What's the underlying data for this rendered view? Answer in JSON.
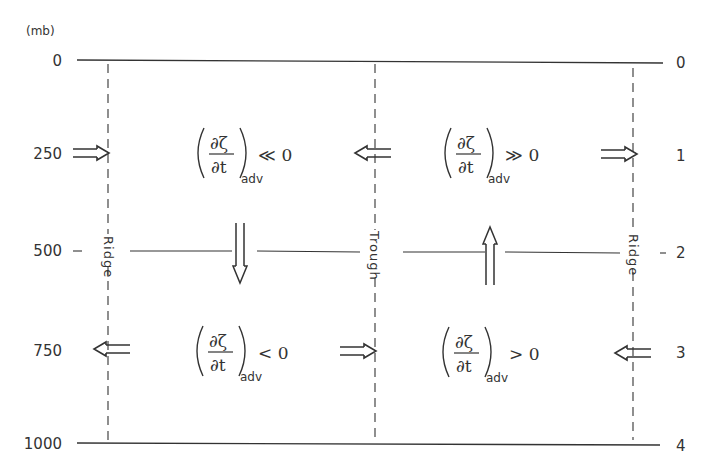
{
  "diagram": {
    "type": "vertical cross-section schematic",
    "left_axis": {
      "unit_label": "(mb)",
      "ticks": [
        "0",
        "250",
        "500",
        "750",
        "1000"
      ]
    },
    "right_axis": {
      "ticks": [
        "0",
        "1",
        "2",
        "3",
        "4"
      ]
    },
    "columns": [
      {
        "label": "Ridge",
        "position": "left"
      },
      {
        "label": "Trough",
        "position": "center"
      },
      {
        "label": "Ridge",
        "position": "right"
      }
    ],
    "upper_level": {
      "left_region": {
        "expression_num": "∂ζ",
        "expression_den": "∂t",
        "subscript": "adv",
        "relation": "≪ 0"
      },
      "right_region": {
        "expression_num": "∂ζ",
        "expression_den": "∂t",
        "subscript": "adv",
        "relation": "≫ 0"
      },
      "arrows": [
        "right",
        "left",
        "right"
      ]
    },
    "middle_level": {
      "arrows": [
        "down",
        "up"
      ]
    },
    "lower_level": {
      "left_region": {
        "expression_num": "∂ζ",
        "expression_den": "∂t",
        "subscript": "adv",
        "relation": "< 0"
      },
      "right_region": {
        "expression_num": "∂ζ",
        "expression_den": "∂t",
        "subscript": "adv",
        "relation": "> 0"
      },
      "arrows": [
        "left",
        "right",
        "left"
      ]
    },
    "colors": {
      "ink": "#333333",
      "background": "#ffffff"
    }
  }
}
